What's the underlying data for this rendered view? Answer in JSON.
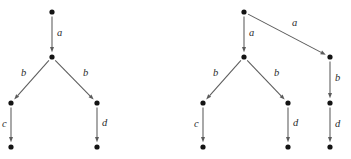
{
  "figure": {
    "name": "two-labelled-transition-diagrams",
    "background_color": "#ffffff",
    "node_color": "#141414",
    "edge_color": "#5b5b5b",
    "label_color": "#2b2b2b",
    "node_radius": 2.6,
    "width": 351,
    "height": 159
  },
  "diagrams": [
    {
      "id": "left-diagram",
      "nodes": [
        {
          "id": "L0",
          "x": 52,
          "y": 12,
          "name": "node-root"
        },
        {
          "id": "L1",
          "x": 52,
          "y": 57,
          "name": "node-mid"
        },
        {
          "id": "L2",
          "x": 11,
          "y": 103,
          "name": "node-left"
        },
        {
          "id": "L3",
          "x": 97,
          "y": 103,
          "name": "node-right"
        },
        {
          "id": "L4",
          "x": 11,
          "y": 147,
          "name": "node-left-leaf"
        },
        {
          "id": "L5",
          "x": 97,
          "y": 147,
          "name": "node-right-leaf"
        }
      ],
      "edges": [
        {
          "from": "L0",
          "to": "L1",
          "label": "a",
          "label_x": 57,
          "label_y": 28,
          "name": "edge-root-to-mid"
        },
        {
          "from": "L1",
          "to": "L2",
          "label": "b",
          "label_x": 21,
          "label_y": 68,
          "name": "edge-mid-to-left"
        },
        {
          "from": "L1",
          "to": "L3",
          "label": "b",
          "label_x": 83,
          "label_y": 68,
          "name": "edge-mid-to-right"
        },
        {
          "from": "L2",
          "to": "L4",
          "label": "c",
          "label_x": 2,
          "label_y": 119,
          "name": "edge-left-to-leaf"
        },
        {
          "from": "L3",
          "to": "L5",
          "label": "d",
          "label_x": 102,
          "label_y": 118,
          "name": "edge-right-to-leaf"
        }
      ]
    },
    {
      "id": "right-diagram",
      "nodes": [
        {
          "id": "R0",
          "x": 244,
          "y": 12,
          "name": "node-root"
        },
        {
          "id": "R1",
          "x": 244,
          "y": 57,
          "name": "node-mid"
        },
        {
          "id": "R2",
          "x": 203,
          "y": 103,
          "name": "node-left"
        },
        {
          "id": "R3",
          "x": 288,
          "y": 103,
          "name": "node-center-right"
        },
        {
          "id": "R4",
          "x": 330,
          "y": 57,
          "name": "node-branch"
        },
        {
          "id": "R5",
          "x": 330,
          "y": 103,
          "name": "node-branch-mid"
        },
        {
          "id": "R6",
          "x": 203,
          "y": 147,
          "name": "node-left-leaf"
        },
        {
          "id": "R7",
          "x": 288,
          "y": 147,
          "name": "node-center-right-leaf"
        },
        {
          "id": "R8",
          "x": 330,
          "y": 147,
          "name": "node-branch-leaf"
        }
      ],
      "edges": [
        {
          "from": "R0",
          "to": "R1",
          "label": "a",
          "label_x": 249,
          "label_y": 28,
          "name": "edge-root-to-mid"
        },
        {
          "from": "R0",
          "to": "R4",
          "label": "a",
          "label_x": 292,
          "label_y": 18,
          "name": "edge-root-to-branch"
        },
        {
          "from": "R1",
          "to": "R2",
          "label": "b",
          "label_x": 213,
          "label_y": 68,
          "name": "edge-mid-to-left"
        },
        {
          "from": "R1",
          "to": "R3",
          "label": "b",
          "label_x": 274,
          "label_y": 68,
          "name": "edge-mid-to-center-right"
        },
        {
          "from": "R4",
          "to": "R5",
          "label": "b",
          "label_x": 335,
          "label_y": 73,
          "name": "edge-branch-to-branch-mid"
        },
        {
          "from": "R2",
          "to": "R6",
          "label": "c",
          "label_x": 194,
          "label_y": 119,
          "name": "edge-left-to-leaf"
        },
        {
          "from": "R3",
          "to": "R7",
          "label": "d",
          "label_x": 293,
          "label_y": 118,
          "name": "edge-center-right-to-leaf"
        },
        {
          "from": "R4_chain",
          "to": "R8",
          "label": "d",
          "label_x": 335,
          "label_y": 119,
          "name": "edge-branch-mid-to-leaf",
          "from_override": "R5"
        }
      ]
    }
  ]
}
